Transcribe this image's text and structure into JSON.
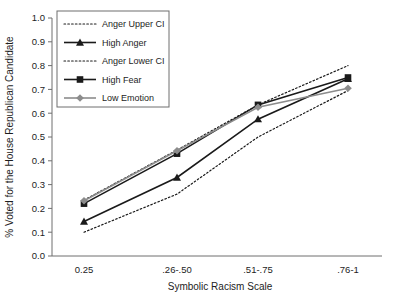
{
  "chart_data": {
    "type": "line",
    "title": "",
    "xlabel": "Symbolic Racism Scale",
    "ylabel": "% Voted for the House Republican Candidate",
    "categories": [
      "0.25",
      ".26-.50",
      ".51-.75",
      ".76-1"
    ],
    "ylim": [
      0.0,
      1.0
    ],
    "ytick_labels": [
      "0.0",
      "0.1",
      "0.2",
      "0.3",
      "0.4",
      "0.5",
      "0.6",
      "0.7",
      "0.8",
      "0.9",
      "1.0"
    ],
    "ytick_values": [
      0.0,
      0.1,
      0.2,
      0.3,
      0.4,
      0.5,
      0.6,
      0.7,
      0.8,
      0.9,
      1.0
    ],
    "grid": false,
    "legend_position": "top-left",
    "series": [
      {
        "name": "Anger Upper CI",
        "style": "dotted",
        "marker": "none",
        "color": "#1a1a1a",
        "values": [
          0.235,
          0.445,
          0.635,
          0.8
        ]
      },
      {
        "name": "High Anger",
        "style": "solid",
        "marker": "triangle",
        "color": "#1a1a1a",
        "values": [
          0.145,
          0.33,
          0.575,
          0.745
        ]
      },
      {
        "name": "Anger Lower CI",
        "style": "dotted",
        "marker": "none",
        "color": "#1a1a1a",
        "values": [
          0.1,
          0.26,
          0.5,
          0.695
        ]
      },
      {
        "name": "High Fear",
        "style": "solid",
        "marker": "square",
        "color": "#1a1a1a",
        "values": [
          0.22,
          0.43,
          0.635,
          0.75
        ]
      },
      {
        "name": "Low Emotion",
        "style": "solid",
        "marker": "diamond",
        "color": "#8c8c8c",
        "values": [
          0.232,
          0.442,
          0.625,
          0.705
        ]
      }
    ]
  },
  "legend": {
    "items": [
      {
        "label": "Anger Upper CI"
      },
      {
        "label": "High Anger"
      },
      {
        "label": "Anger Lower CI"
      },
      {
        "label": "High Fear"
      },
      {
        "label": "Low Emotion"
      }
    ]
  },
  "colors": {
    "axis": "#6e6e6e",
    "text": "#1d1d1d",
    "dark_series": "#1a1a1a",
    "gray_series": "#8c8c8c",
    "legend_border": "#6e6e6e"
  }
}
